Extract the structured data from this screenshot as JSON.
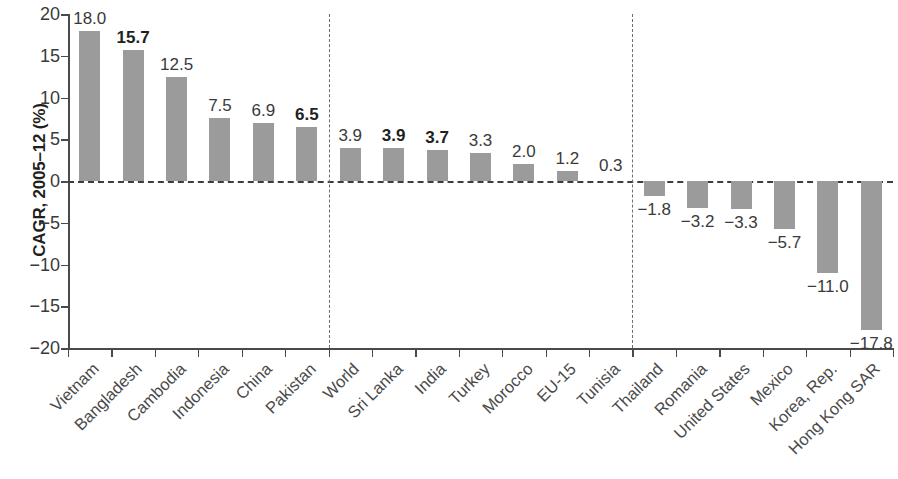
{
  "chart_data": {
    "type": "bar",
    "title": "",
    "subtitle": "",
    "xlabel": "",
    "ylabel": "CAGR, 2005–12 (%)",
    "ylim": [
      -20,
      20
    ],
    "ytick_values": [
      20,
      15,
      10,
      5,
      0,
      -5,
      -10,
      -15,
      -20
    ],
    "ytick_labels": [
      "20",
      "15",
      "10",
      "5",
      "0",
      "−5",
      "−10",
      "−15",
      "−20"
    ],
    "grid": false,
    "legend": null,
    "zero_line": true,
    "group_separators_after": [
      "Pakistan",
      "Tunisia"
    ],
    "categories": [
      "Vietnam",
      "Bangladesh",
      "Cambodia",
      "Indonesia",
      "China",
      "Pakistan",
      "World",
      "Sri Lanka",
      "India",
      "Turkey",
      "Morocco",
      "EU-15",
      "Tunisia",
      "Thailand",
      "Romania",
      "United States",
      "Mexico",
      "Korea, Rep.",
      "Hong Kong SAR"
    ],
    "values": [
      18.0,
      15.7,
      12.5,
      7.5,
      6.9,
      6.5,
      3.9,
      3.9,
      3.7,
      3.3,
      2.0,
      1.2,
      0.3,
      -1.8,
      -3.2,
      -3.3,
      -5.7,
      -11.0,
      -17.8
    ],
    "value_labels": [
      "18.0",
      "15.7",
      "12.5",
      "7.5",
      "6.9",
      "6.5",
      "3.9",
      "3.9",
      "3.7",
      "3.3",
      "2.0",
      "1.2",
      "0.3",
      "−1.8",
      "−3.2",
      "−3.3",
      "−5.7",
      "−11.0",
      "−17.8"
    ],
    "value_label_bold": [
      false,
      true,
      false,
      false,
      false,
      true,
      false,
      true,
      true,
      false,
      false,
      false,
      false,
      false,
      false,
      false,
      false,
      false,
      false
    ],
    "bar_color": "#9b9b9b",
    "axis_color": "#4a4a4a",
    "text_color": "#3a3a3a"
  }
}
